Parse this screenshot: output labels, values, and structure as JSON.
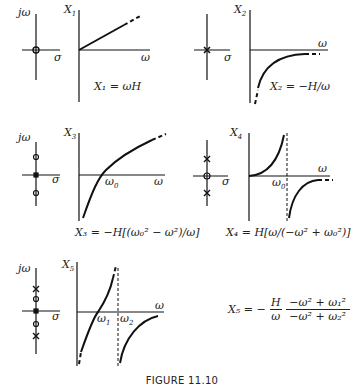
{
  "figure": {
    "caption": "FIGURE 11.10",
    "axis_labels": {
      "imag": "jω",
      "real": "σ",
      "freq": "ω"
    },
    "panels": [
      {
        "id": "X1",
        "ylabel": "X",
        "ysub": "1",
        "equation": "X₁ = ωH",
        "pole_zero": {
          "origin": "zero",
          "zeros": [],
          "poles": []
        },
        "curve": "line through origin, positive slope"
      },
      {
        "id": "X2",
        "ylabel": "X",
        "ysub": "2",
        "equation": "X₂ = −H/ω",
        "pole_zero": {
          "origin": "pole",
          "zeros": [],
          "poles": []
        },
        "curve": "negative branch rising toward 0"
      },
      {
        "id": "X3",
        "ylabel": "X",
        "ysub": "3",
        "equation": "X₃ = −H[(ω₀² − ω²)/ω]",
        "marker": "ω₀",
        "pole_zero": {
          "origin": "pole",
          "zeros": [
            "+jω₀",
            "−jω₀"
          ],
          "poles": []
        },
        "curve": "crosses axis at ω₀"
      },
      {
        "id": "X4",
        "ylabel": "X",
        "ysub": "4",
        "equation": "X₄ = H[ω/(−ω² + ω₀²)]",
        "marker": "ω₀",
        "pole_zero": {
          "origin": "zero",
          "zeros": [],
          "poles": [
            "+jω₀",
            "−jω₀"
          ]
        },
        "curve": "asymptote at ω₀"
      },
      {
        "id": "X5",
        "ylabel": "X",
        "ysub": "5",
        "equation_lhs": "X₅ = −",
        "equation_frac1_num": "H",
        "equation_frac1_den": "ω",
        "equation_frac2_num": "−ω² + ω₁²",
        "equation_frac2_den": "−ω² + ω₂²",
        "markers": [
          "ω₁",
          "ω₂"
        ],
        "pole_zero": {
          "origin": "pole",
          "zeros": [
            "+jω₁",
            "−jω₁"
          ],
          "poles": [
            "+jω₂",
            "−jω₂"
          ]
        },
        "curve": "zero at ω₁, asymptote at ω₂"
      }
    ]
  }
}
